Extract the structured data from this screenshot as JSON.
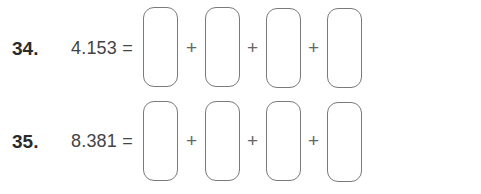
{
  "problems": [
    {
      "number": "34.",
      "expression": "4.153 =",
      "operator": "+",
      "boxes": 4
    },
    {
      "number": "35.",
      "expression": "8.381 =",
      "operator": "+",
      "boxes": 4
    }
  ]
}
